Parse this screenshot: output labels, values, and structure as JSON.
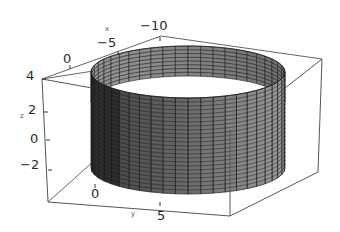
{
  "chart_data": {
    "type": "surface3d",
    "title": "",
    "shape": "cylinder",
    "radius_approx": 8,
    "z_range": [
      -2.5,
      3.5
    ],
    "mesh": {
      "angular_segments": 24,
      "height_segments": 24
    },
    "axes": {
      "x": {
        "label": "x",
        "ticks": [
          "0",
          "-5",
          "-10"
        ]
      },
      "y": {
        "label": "y",
        "ticks": [
          "0",
          "5"
        ]
      },
      "z": {
        "label": "z",
        "ticks": [
          "4",
          "2",
          "0",
          "-2"
        ]
      }
    },
    "box": true,
    "grid": false,
    "legend": null,
    "colors": {
      "surface_light": "#9a9a9a",
      "surface_dark": "#3a3a3a",
      "mesh": "#1a1a1a",
      "box": "#555555"
    }
  },
  "labels": {
    "x_axis": "x",
    "y_axis": "y",
    "z_axis": "z",
    "x_ticks": [
      "0",
      "−5",
      "−10"
    ],
    "y_ticks": [
      "0",
      "5"
    ],
    "z_ticks": [
      "4",
      "2",
      "0",
      "−2"
    ]
  }
}
